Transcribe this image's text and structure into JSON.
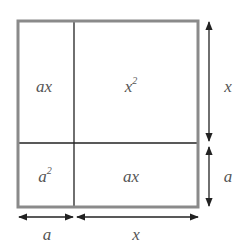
{
  "diagram": {
    "regions": [
      {
        "id": "top-left",
        "label": "ax",
        "sup": ""
      },
      {
        "id": "top-right",
        "label": "x",
        "sup": "2"
      },
      {
        "id": "bottom-left",
        "label": "a",
        "sup": "2"
      },
      {
        "id": "bottom-right",
        "label": "ax",
        "sup": ""
      }
    ],
    "dimensions": {
      "right_top": "x",
      "right_bottom": "a",
      "bottom_left": "a",
      "bottom_right": "x"
    },
    "colors": {
      "outer_border": "#8a8a8a",
      "inner_lines": "#222222",
      "arrows": "#222222",
      "labels": "#555555"
    }
  }
}
